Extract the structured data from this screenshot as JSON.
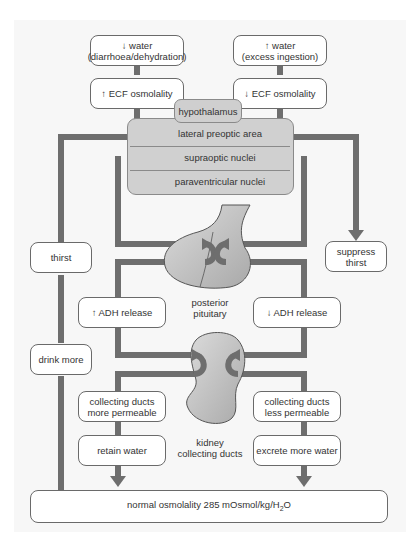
{
  "diagram": {
    "stimuli": {
      "decrease_water": "↓ water\n(diarrhoea/dehydration)",
      "increase_water": "↑ water\n(excess ingestion)",
      "increase_ecf": "↑ ECF osmolality",
      "decrease_ecf": "↓ ECF osmolality"
    },
    "hypothalamus": {
      "title": "hypothalamus",
      "nuclei": [
        "lateral preoptic area",
        "supraoptic nuclei",
        "paraventricular nuclei"
      ]
    },
    "thirst": {
      "increase": "thirst",
      "suppress": "suppress\nthirst",
      "drink": "drink more"
    },
    "pituitary": {
      "label": "posterior\npituitary",
      "increase_adh": "↑ ADH release",
      "decrease_adh": "↓ ADH release"
    },
    "kidney": {
      "label": "kidney\ncollecting ducts",
      "more_permeable": "collecting ducts\nmore permeable",
      "less_permeable": "collecting ducts\nless permeable",
      "retain": "retain water",
      "excrete": "excrete more water"
    },
    "outcome": {
      "text_prefix": "normal osmolality 285 mOsmol/kg/H",
      "subscript": "2",
      "text_suffix": "O"
    },
    "colors": {
      "arrow": "#6e6e6e",
      "organ_fill": "#c4c4c4",
      "hypothalamus_fill": "#d0d0d0",
      "box_border": "#6a6a6a",
      "background_panel": "#f7f7f7"
    }
  }
}
